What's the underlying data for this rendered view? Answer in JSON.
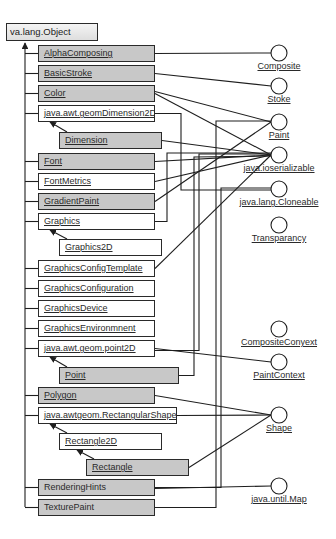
{
  "root": {
    "label": "va.lang.Object",
    "x": 6,
    "y": 23,
    "w": 92
  },
  "classes": [
    {
      "id": "alphacomposing",
      "label": "AlphaComposing",
      "x": 38,
      "y": 45,
      "w": 117,
      "shaded": true,
      "underline": true
    },
    {
      "id": "basicstroke",
      "label": "BasicStroke",
      "x": 38,
      "y": 65,
      "w": 117,
      "shaded": true,
      "underline": true
    },
    {
      "id": "color",
      "label": "Color",
      "x": 38,
      "y": 85,
      "w": 117,
      "shaded": true,
      "underline": true
    },
    {
      "id": "dimension2d",
      "label": "java.awt.geomDimension2D",
      "x": 38,
      "y": 105,
      "w": 117,
      "shaded": false,
      "underline": true
    },
    {
      "id": "dimension",
      "label": "Dimension",
      "x": 59,
      "y": 132,
      "w": 103,
      "shaded": true,
      "underline": true
    },
    {
      "id": "font",
      "label": "Font",
      "x": 38,
      "y": 153,
      "w": 117,
      "shaded": true,
      "underline": true
    },
    {
      "id": "fontmetrics",
      "label": "FontMetrics",
      "x": 38,
      "y": 173,
      "w": 117,
      "shaded": false,
      "underline": true
    },
    {
      "id": "gradientpaint",
      "label": "GradientPaint",
      "x": 38,
      "y": 193,
      "w": 117,
      "shaded": true,
      "underline": true
    },
    {
      "id": "graphics",
      "label": "Graphics",
      "x": 38,
      "y": 213,
      "w": 117,
      "shaded": false,
      "underline": true
    },
    {
      "id": "graphics2d",
      "label": "Graphics2D",
      "x": 59,
      "y": 239,
      "w": 103,
      "shaded": false,
      "underline": true
    },
    {
      "id": "gct",
      "label": "GraphicsConfigTemplate",
      "x": 38,
      "y": 260,
      "w": 117,
      "shaded": false,
      "underline": true
    },
    {
      "id": "gconfig",
      "label": "GraphicsConfiguration",
      "x": 38,
      "y": 280,
      "w": 117,
      "shaded": false,
      "underline": true
    },
    {
      "id": "gdevice",
      "label": "GraphicsDevice",
      "x": 38,
      "y": 300,
      "w": 117,
      "shaded": false,
      "underline": true
    },
    {
      "id": "genv",
      "label": "GraphicsEnvironmnent",
      "x": 38,
      "y": 320,
      "w": 117,
      "shaded": false,
      "underline": true
    },
    {
      "id": "point2d",
      "label": "java.awt.geom.point2D",
      "x": 38,
      "y": 340,
      "w": 117,
      "shaded": false,
      "underline": true
    },
    {
      "id": "point",
      "label": "Point",
      "x": 59,
      "y": 367,
      "w": 120,
      "shaded": true,
      "underline": true
    },
    {
      "id": "polygon",
      "label": "Polygon",
      "x": 38,
      "y": 387,
      "w": 117,
      "shaded": true,
      "underline": true
    },
    {
      "id": "rectshape",
      "label": "java.awtgeom.RectangularShape",
      "x": 38,
      "y": 407,
      "w": 139,
      "shaded": false,
      "underline": true
    },
    {
      "id": "rect2d",
      "label": "Rectangle2D",
      "x": 59,
      "y": 433,
      "w": 103,
      "shaded": false,
      "underline": true
    },
    {
      "id": "rectangle",
      "label": "Rectangle",
      "x": 86,
      "y": 459,
      "w": 103,
      "shaded": true,
      "underline": true
    },
    {
      "id": "renderinghints",
      "label": "RenderingHints",
      "x": 38,
      "y": 479,
      "w": 117,
      "shaded": true,
      "underline": false
    },
    {
      "id": "texturepaint",
      "label": "TexturePaint",
      "x": 38,
      "y": 499,
      "w": 117,
      "shaded": true,
      "underline": false
    }
  ],
  "interfaces": [
    {
      "id": "composite",
      "label": "Composite",
      "cx": 279,
      "cy": 53
    },
    {
      "id": "stoke",
      "label": "Stoke",
      "cx": 279,
      "cy": 86
    },
    {
      "id": "paint",
      "label": "Paint",
      "cx": 279,
      "cy": 122
    },
    {
      "id": "serializable",
      "label": "java.ioserializable",
      "cx": 279,
      "cy": 155
    },
    {
      "id": "cloneable",
      "label": "java.lang.Cloneable",
      "cx": 279,
      "cy": 189
    },
    {
      "id": "transparancy",
      "label": "Transparancy",
      "cx": 279,
      "cy": 225
    },
    {
      "id": "compositecontext",
      "label": "CompositeConyext",
      "cx": 279,
      "cy": 329
    },
    {
      "id": "paintcontext",
      "label": "PaintContext",
      "cx": 279,
      "cy": 362
    },
    {
      "id": "shape",
      "label": "Shape",
      "cx": 279,
      "cy": 415
    },
    {
      "id": "map",
      "label": "java.until.Map",
      "cx": 279,
      "cy": 486
    }
  ],
  "colors": {
    "line": "#1e1e1e",
    "shaded": "#c8c8c8",
    "plain": "#ffffff",
    "border": "#2a2a2a"
  }
}
